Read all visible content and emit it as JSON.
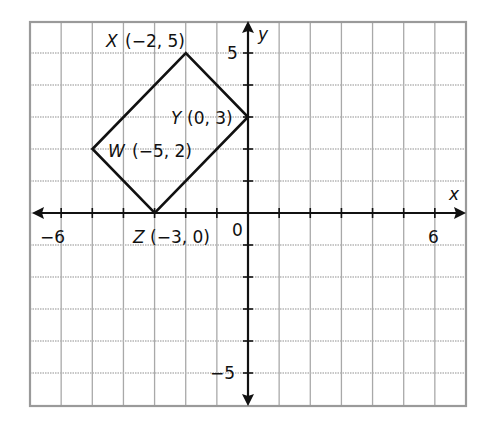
{
  "chart_data": {
    "type": "coordinate-plane",
    "title": "",
    "xlabel": "x",
    "ylabel": "y",
    "xlim": [
      -7,
      7
    ],
    "ylim": [
      -6,
      6
    ],
    "grid": true,
    "tick_labels": {
      "x": [
        {
          "value": -6,
          "label": "−6"
        },
        {
          "value": 6,
          "label": "6"
        }
      ],
      "y": [
        {
          "value": 5,
          "label": "5"
        },
        {
          "value": -5,
          "label": "−5"
        }
      ],
      "origin": "0"
    },
    "polygon": {
      "name": "WXYZ",
      "points": [
        {
          "name": "W",
          "x": -5,
          "y": 2,
          "label": "(−5, 2)"
        },
        {
          "name": "X",
          "x": -2,
          "y": 5,
          "label": "(−2, 5)"
        },
        {
          "name": "Y",
          "x": 0,
          "y": 3,
          "label": "(0, 3)"
        },
        {
          "name": "Z",
          "x": -3,
          "y": 0,
          "label": "(−3, 0)"
        }
      ]
    }
  },
  "labels": {
    "axis_x": "x",
    "axis_y": "y",
    "origin": "0",
    "tick_x_neg6": "−6",
    "tick_x_6": "6",
    "tick_y_5": "5",
    "tick_y_neg5": "−5",
    "point_x_name": "X",
    "point_x_coords": "(−2, 5)",
    "point_y_name": "Y",
    "point_y_coords": "(0, 3)",
    "point_w_name": "W",
    "point_w_coords": "(−5, 2)",
    "point_z_name": "Z",
    "point_z_coords": "(−3, 0)"
  },
  "colors": {
    "grid": "#a9a9a9",
    "axis": "#111111",
    "background": "#ffffff"
  }
}
